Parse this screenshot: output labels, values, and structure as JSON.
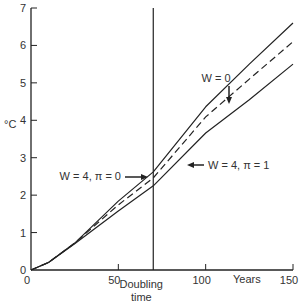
{
  "chart_data": {
    "type": "line",
    "title": "",
    "xlabel": "Years",
    "ylabel": "°C",
    "xlim": [
      0,
      150
    ],
    "ylim": [
      0,
      7
    ],
    "xticks": [
      0,
      50,
      100,
      150
    ],
    "yticks": [
      0,
      1,
      2,
      3,
      4,
      5,
      6,
      7
    ],
    "grid": false,
    "vertical_marker": {
      "x": 70,
      "label_line1": "Doubling",
      "label_line2": "time"
    },
    "x": [
      0,
      10,
      25,
      50,
      70,
      100,
      125,
      150
    ],
    "series": [
      {
        "name": "W = 0",
        "style": "solid",
        "values": [
          0,
          0.2,
          0.72,
          1.84,
          2.62,
          4.36,
          5.5,
          6.6
        ]
      },
      {
        "name": "W = 4, π = 0",
        "style": "dashed",
        "values": [
          0,
          0.2,
          0.72,
          1.74,
          2.46,
          4.09,
          5.1,
          6.1
        ]
      },
      {
        "name": "W = 4, π = 1",
        "style": "solid",
        "values": [
          0,
          0.2,
          0.7,
          1.58,
          2.25,
          3.66,
          4.55,
          5.5
        ]
      }
    ],
    "annotations": [
      {
        "text": "W = 0",
        "arrow": "down",
        "target_series": 0
      },
      {
        "text": "W = 4, π = 0",
        "arrow": "right",
        "target_series": 1
      },
      {
        "text": "W = 4, π = 1",
        "arrow": "left",
        "target_series": 2
      }
    ]
  },
  "colors": {
    "line": "#222222",
    "text": "#333333",
    "background": "#ffffff"
  }
}
